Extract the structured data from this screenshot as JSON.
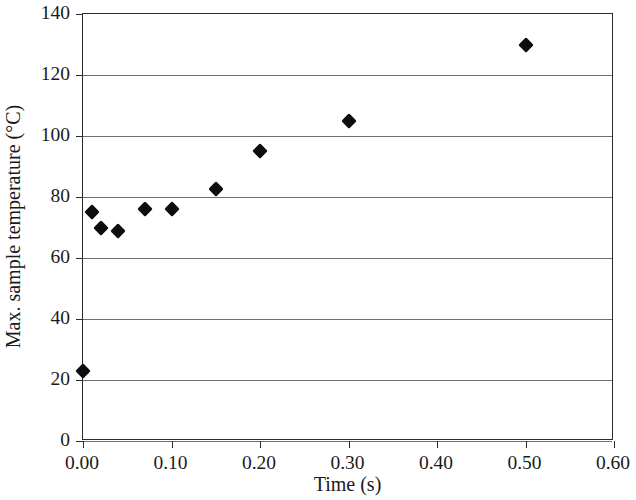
{
  "chart_data": {
    "type": "scatter",
    "title": "",
    "xlabel": "Time (s)",
    "ylabel": "Max. sample temperature (°C)",
    "xlim": [
      0.0,
      0.6
    ],
    "ylim": [
      0,
      140
    ],
    "grid": true,
    "legend": null,
    "x_ticks": [
      "0.00",
      "0.10",
      "0.20",
      "0.30",
      "0.40",
      "0.50",
      "0.60"
    ],
    "x_tick_values": [
      0.0,
      0.1,
      0.2,
      0.3,
      0.4,
      0.5,
      0.6
    ],
    "y_ticks": [
      "0",
      "20",
      "40",
      "60",
      "80",
      "100",
      "120",
      "140"
    ],
    "y_tick_values": [
      0,
      20,
      40,
      60,
      80,
      100,
      120,
      140
    ],
    "marker": "diamond",
    "marker_color": "#0d0d0d",
    "x": [
      0.0,
      0.01,
      0.02,
      0.04,
      0.07,
      0.1,
      0.15,
      0.2,
      0.3,
      0.5
    ],
    "y": [
      23,
      75,
      70,
      69,
      76,
      76,
      82.5,
      95,
      105,
      130
    ],
    "points": [
      {
        "x": 0.0,
        "y": 23
      },
      {
        "x": 0.01,
        "y": 75
      },
      {
        "x": 0.02,
        "y": 70
      },
      {
        "x": 0.04,
        "y": 69
      },
      {
        "x": 0.07,
        "y": 76
      },
      {
        "x": 0.1,
        "y": 76
      },
      {
        "x": 0.15,
        "y": 82.5
      },
      {
        "x": 0.2,
        "y": 95
      },
      {
        "x": 0.3,
        "y": 105
      },
      {
        "x": 0.5,
        "y": 130
      }
    ]
  }
}
